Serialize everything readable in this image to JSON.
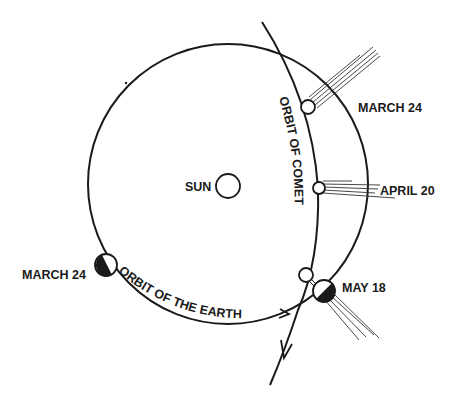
{
  "diagram": {
    "title": "",
    "bodies": {
      "sun": {
        "label": "SUN"
      },
      "earth_start": {
        "label": "MARCH 24"
      },
      "earth_end": {
        "label": "MAY 18"
      }
    },
    "orbits": {
      "earth": {
        "label": "ORBIT OF THE EARTH"
      },
      "comet": {
        "label": "ORBIT OF COMET"
      }
    },
    "comet_positions": [
      {
        "label": "MARCH 24"
      },
      {
        "label": "APRIL 20"
      },
      {
        "label": "MAY 18"
      }
    ],
    "colors": {
      "ink": "#1a1a1a",
      "background": "#ffffff"
    }
  }
}
